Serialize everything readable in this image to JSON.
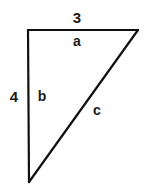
{
  "diagram": {
    "type": "right-triangle",
    "stroke_color": "#111111",
    "stroke_width": 2.2,
    "background": "#ffffff",
    "vertices": {
      "top_left": [
        28,
        30
      ],
      "top_right": [
        138,
        30
      ],
      "bottom": [
        29,
        182
      ]
    },
    "sides": {
      "a": {
        "name": "a",
        "length": "3",
        "position": "top"
      },
      "b": {
        "name": "b",
        "length": "4",
        "position": "left"
      },
      "c": {
        "name": "c",
        "length": "",
        "position": "hypotenuse"
      }
    },
    "labels": {
      "top_measure": {
        "text": "3",
        "x": 77,
        "y": 17
      },
      "top_side": {
        "text": "a",
        "x": 77,
        "y": 41
      },
      "left_measure": {
        "text": "4",
        "x": 14,
        "y": 96
      },
      "left_side": {
        "text": "b",
        "x": 42,
        "y": 96
      },
      "hypotenuse_side": {
        "text": "c",
        "x": 97,
        "y": 110
      }
    }
  }
}
